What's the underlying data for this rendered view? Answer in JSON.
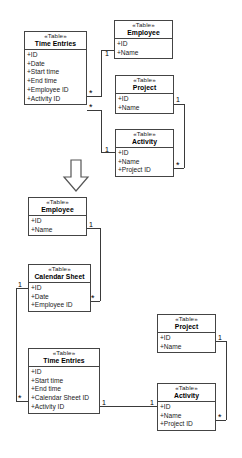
{
  "diagram": {
    "kind": "uml-class-diagram",
    "stereotype": "«Table»",
    "transform_arrow": "down-arrow",
    "upper": {
      "tables": [
        {
          "id": "time-entries",
          "name": "Time Entries",
          "stereotype": "«Table»",
          "attributes": [
            "+ID",
            "+Date",
            "+Start time",
            "+End time",
            "+Employee ID",
            "+Activity ID"
          ]
        },
        {
          "id": "employee",
          "name": "Employee",
          "stereotype": "«Table»",
          "attributes": [
            "+ID",
            "+Name"
          ]
        },
        {
          "id": "project",
          "name": "Project",
          "stereotype": "«Table»",
          "attributes": [
            "+ID",
            "+Name"
          ]
        },
        {
          "id": "activity",
          "name": "Activity",
          "stereotype": "«Table»",
          "attributes": [
            "+ID",
            "+Name",
            "+Project ID"
          ]
        }
      ],
      "multiplicities": {
        "time_entries_to_employee": "*",
        "employee_end": "1",
        "time_entries_to_activity": "*",
        "activity_end": "1",
        "project_end": "1",
        "activity_project_end": "*"
      }
    },
    "lower": {
      "tables": [
        {
          "id": "employee",
          "name": "Employee",
          "stereotype": "«Table»",
          "attributes": [
            "+ID",
            "+Name"
          ]
        },
        {
          "id": "calendar-sheet",
          "name": "Calendar Sheet",
          "stereotype": "«Table»",
          "attributes": [
            "+ID",
            "+Date",
            "+Employee ID"
          ]
        },
        {
          "id": "time-entries",
          "name": "Time Entries",
          "stereotype": "«Table»",
          "attributes": [
            "+ID",
            "+Start time",
            "+End time",
            "+Calendar Sheet ID",
            "+Activity ID"
          ]
        },
        {
          "id": "project",
          "name": "Project",
          "stereotype": "«Table»",
          "attributes": [
            "+ID",
            "+Name"
          ]
        },
        {
          "id": "activity",
          "name": "Activity",
          "stereotype": "«Table»",
          "attributes": [
            "+ID",
            "+Name",
            "+Project ID"
          ]
        }
      ],
      "multiplicities": {
        "employee_end": "1",
        "calendar_sheet_to_employee": "*",
        "calendar_sheet_end": "1",
        "time_entries_to_calendar_sheet": "*",
        "time_entries_to_activity": "1",
        "activity_end": "1",
        "project_end": "1",
        "activity_project_end": "*"
      }
    }
  },
  "colors": {
    "line": "#3a3a3a",
    "border": "#444444",
    "background": "#ffffff",
    "text": "#1a1a1a"
  }
}
